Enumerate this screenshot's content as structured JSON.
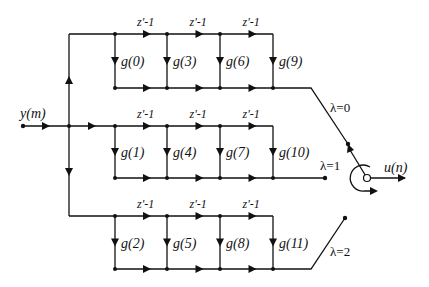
{
  "diagram": {
    "type": "polyphase filter bank signal-flow diagram",
    "input": {
      "label": "y(m)"
    },
    "output": {
      "label": "u(n)"
    },
    "delay_label": "z'-1",
    "branches": [
      {
        "id": 0,
        "switch_label": "λ=0",
        "coefficients": [
          "g(0)",
          "g(3)",
          "g(6)",
          "g(9)"
        ]
      },
      {
        "id": 1,
        "switch_label": "λ=1",
        "coefficients": [
          "g(1)",
          "g(4)",
          "g(7)",
          "g(10)"
        ]
      },
      {
        "id": 2,
        "switch_label": "λ=2",
        "coefficients": [
          "g(2)",
          "g(5)",
          "g(8)",
          "g(11)"
        ]
      }
    ],
    "colors": {
      "line": "#111111",
      "background": "#ffffff"
    }
  }
}
